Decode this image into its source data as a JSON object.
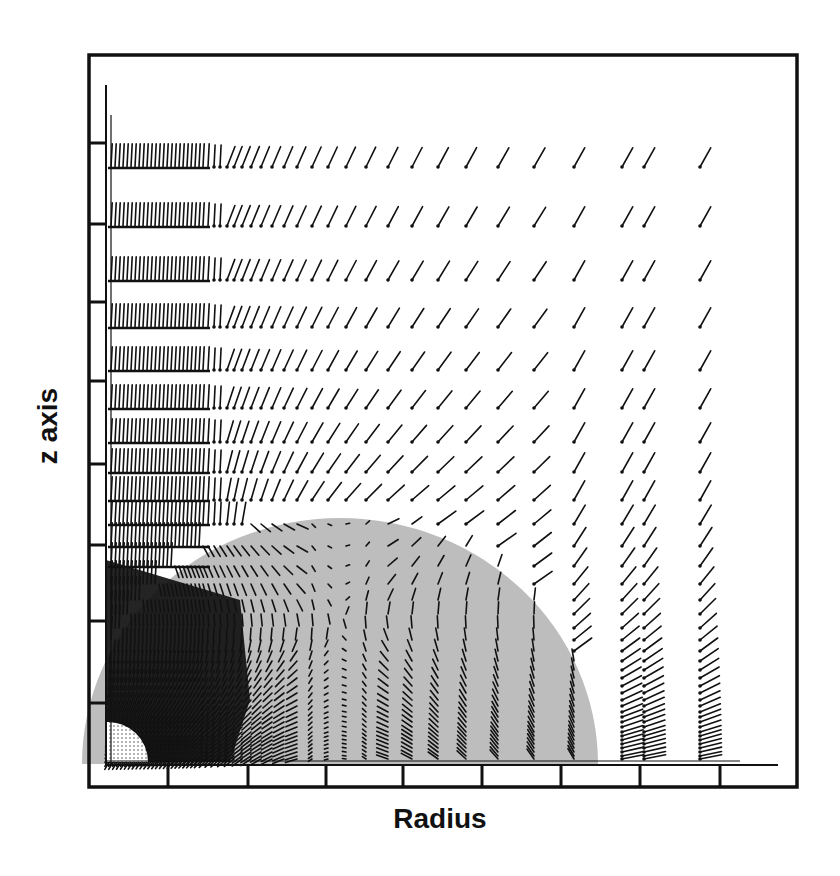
{
  "chart_data": {
    "type": "vector-field",
    "title": "",
    "xlabel": "Radius",
    "ylabel": "z axis",
    "colors": {
      "background": "#ffffff",
      "ink": "#111111",
      "sphere_fill": "#bdbdbd"
    },
    "frame": {
      "left": 89,
      "top": 55,
      "right": 797,
      "bottom": 787
    },
    "inner_axes": {
      "x0": 106,
      "y0": 765
    },
    "x_ticks_px": [
      168,
      248,
      326,
      403,
      482,
      561,
      640,
      720
    ],
    "y_ticks_px": [
      143,
      224,
      302,
      381,
      464,
      545,
      621,
      703
    ],
    "sphere": {
      "cx": 340,
      "base_y": 764,
      "rx": 258,
      "ry": 246
    },
    "inner_core": {
      "cx": 108,
      "base_y": 762,
      "r": 40,
      "pattern": "dotted"
    },
    "grid_columns_px": [
      111,
      115,
      119,
      123,
      127,
      131,
      135,
      139,
      143,
      147,
      151,
      155,
      159,
      163,
      167,
      171,
      175,
      179,
      183,
      187,
      191,
      195,
      199,
      203,
      208,
      214,
      220,
      227,
      234,
      242,
      251,
      261,
      272,
      284,
      297,
      312,
      328,
      346,
      366,
      388,
      412,
      438,
      466,
      498,
      534,
      574,
      622,
      644,
      700
    ],
    "grid_rows_px": [
      167,
      226,
      280,
      327,
      370,
      408,
      442,
      472,
      500,
      524,
      546,
      566,
      584,
      600,
      614,
      628,
      640,
      651,
      661,
      670,
      678,
      686,
      693,
      700,
      706,
      712,
      717,
      722,
      727,
      732,
      736,
      740,
      744,
      748,
      752,
      756,
      759
    ],
    "arrow_style": {
      "dot_radius": 1.8,
      "max_length": 22,
      "stroke_width": 1.6
    }
  }
}
